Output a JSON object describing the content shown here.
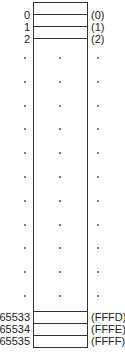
{
  "diagram": {
    "type": "memory-address-map",
    "top_rows": [
      {
        "decimal": "0",
        "hex": "(0)"
      },
      {
        "decimal": "1",
        "hex": "(1)"
      },
      {
        "decimal": "2",
        "hex": "(2)"
      }
    ],
    "bottom_rows": [
      {
        "decimal": "65533",
        "hex": "(FFFD)"
      },
      {
        "decimal": "65534",
        "hex": "(FFFE)"
      },
      {
        "decimal": "65535",
        "hex": "(FFFF)"
      }
    ],
    "ellipsis_rows": 11,
    "colors": {
      "line": "#333333",
      "text": "#222222",
      "background": "#ffffff"
    }
  }
}
